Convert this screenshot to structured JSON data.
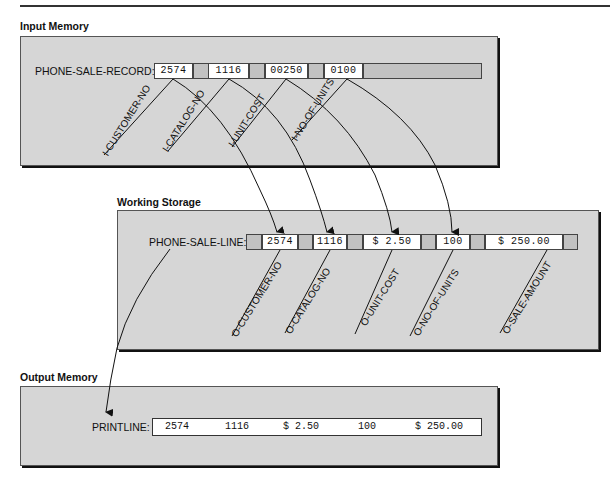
{
  "sections": {
    "input": {
      "title": "Input Memory"
    },
    "working": {
      "title": "Working Storage"
    },
    "output": {
      "title": "Output Memory"
    }
  },
  "input_record": {
    "label": "PHONE-SALE-RECORD:",
    "fields": [
      {
        "value": "2574",
        "name": "I-CUSTOMER-NO"
      },
      {
        "value": "1116",
        "name": "I-CATALOG-NO"
      },
      {
        "value": "00250",
        "name": "I-UNIT-COST"
      },
      {
        "value": "0100",
        "name": "I-NO-OF-UNITS"
      }
    ]
  },
  "working_record": {
    "label": "PHONE-SALE-LINE:",
    "fields": [
      {
        "value": "2574",
        "name": "O-CUSTOMER-NO"
      },
      {
        "value": "1116",
        "name": "O-CATALOG-NO"
      },
      {
        "value": "$ 2.50",
        "name": "O-UNIT-COST"
      },
      {
        "value": "100",
        "name": "O-NO-OF-UNITS"
      },
      {
        "value": "$ 250.00",
        "name": "O-SALE-AMOUNT"
      }
    ]
  },
  "output_record": {
    "label": "PRINTLINE:",
    "values": [
      "2574",
      "1116",
      "$ 2.50",
      "100",
      "$ 250.00"
    ]
  },
  "colors": {
    "panel": "#d6d6d6",
    "filler": "#c2c2c2",
    "field": "#ffffff",
    "line": "#111111"
  }
}
